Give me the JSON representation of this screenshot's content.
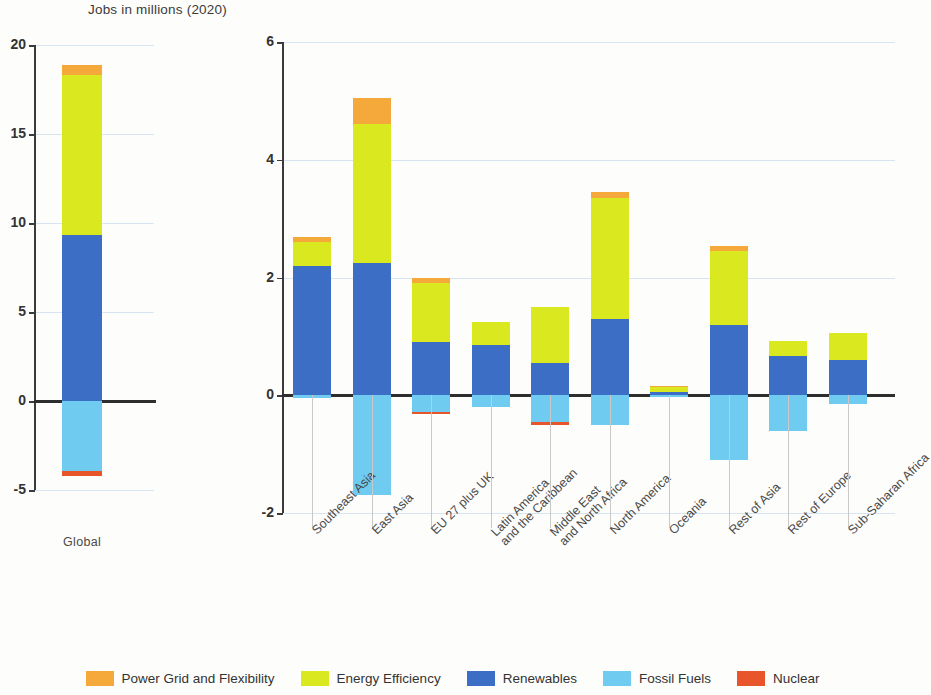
{
  "title": "Jobs in millions (2020)",
  "colors": {
    "power_grid": "#F6A93B",
    "energy_efficiency": "#D9E81F",
    "renewables": "#3B6EC4",
    "fossil_fuels": "#6FCCF0",
    "nuclear": "#E8552B",
    "axis": "#3b3b3b",
    "grid": "#cfe0ef"
  },
  "legend": {
    "position": "bottom",
    "items": [
      {
        "label": "Power Grid and Flexibility",
        "color": "#F6A93B",
        "key": "power_grid"
      },
      {
        "label": "Energy Efficiency",
        "color": "#D9E81F",
        "key": "energy_efficiency"
      },
      {
        "label": "Renewables",
        "color": "#3B6EC4",
        "key": "renewables"
      },
      {
        "label": "Fossil Fuels",
        "color": "#6FCCF0",
        "key": "fossil_fuels"
      },
      {
        "label": "Nuclear",
        "color": "#E8552B",
        "key": "nuclear"
      }
    ]
  },
  "chart_data": [
    {
      "type": "bar",
      "id": "global",
      "stacked": true,
      "title": "Jobs in millions (2020)",
      "xlabel": "",
      "ylabel": "Jobs in millions (2020)",
      "ylim": [
        -5,
        20
      ],
      "yticks": [
        -5,
        0,
        5,
        10,
        15,
        20
      ],
      "ytick_labels": [
        "-5",
        "0",
        "5",
        "10",
        "15",
        "20"
      ],
      "grid": true,
      "categories": [
        "Global"
      ],
      "series": [
        {
          "name": "Renewables",
          "color": "#3B6EC4",
          "values": [
            9.3
          ]
        },
        {
          "name": "Energy Efficiency",
          "color": "#D9E81F",
          "values": [
            9.0
          ]
        },
        {
          "name": "Power Grid and Flexibility",
          "color": "#F6A93B",
          "values": [
            0.6
          ]
        },
        {
          "name": "Fossil Fuels",
          "color": "#6FCCF0",
          "values": [
            -3.95
          ]
        },
        {
          "name": "Nuclear",
          "color": "#E8552B",
          "values": [
            -0.25
          ]
        }
      ],
      "totals_positive": [
        18.9
      ],
      "totals_negative": [
        -4.2
      ]
    },
    {
      "type": "bar",
      "id": "regions",
      "stacked": true,
      "title": "",
      "xlabel": "",
      "ylabel": "Jobs in millions (2020)",
      "ylim": [
        -2,
        6
      ],
      "yticks": [
        -2,
        0,
        2,
        4,
        6
      ],
      "ytick_labels": [
        "-2",
        "0",
        "2",
        "4",
        "6"
      ],
      "grid": true,
      "categories": [
        "Southeast Asia",
        "East Asia",
        "EU 27 plus UK",
        "Latin America\nand the Caribbean",
        "Middle East\nand North Africa",
        "North America",
        "Oceania",
        "Rest of Asia",
        "Rest of Europe",
        "Sub-Saharan Africa"
      ],
      "series": [
        {
          "name": "Renewables",
          "color": "#3B6EC4",
          "values": [
            2.2,
            2.25,
            0.9,
            0.85,
            0.55,
            1.3,
            0.06,
            1.2,
            0.67,
            0.6
          ]
        },
        {
          "name": "Energy Efficiency",
          "color": "#D9E81F",
          "values": [
            0.4,
            2.35,
            1.0,
            0.4,
            0.95,
            2.05,
            0.08,
            1.25,
            0.25,
            0.45
          ]
        },
        {
          "name": "Power Grid and Flexibility",
          "color": "#F6A93B",
          "values": [
            0.08,
            0.45,
            0.1,
            0.0,
            0.0,
            0.1,
            0.02,
            0.08,
            0.0,
            0.0
          ]
        },
        {
          "name": "Fossil Fuels",
          "color": "#6FCCF0",
          "values": [
            -0.05,
            -1.7,
            -0.28,
            -0.2,
            -0.45,
            -0.5,
            -0.02,
            -1.1,
            -0.6,
            -0.15
          ]
        },
        {
          "name": "Nuclear",
          "color": "#E8552B",
          "values": [
            0.0,
            0.0,
            -0.03,
            0.0,
            -0.05,
            0.0,
            0.0,
            0.0,
            0.0,
            0.0
          ]
        }
      ],
      "totals_positive": [
        2.68,
        5.05,
        2.0,
        1.25,
        1.5,
        3.45,
        0.16,
        2.53,
        0.92,
        1.05
      ],
      "totals_negative": [
        -0.05,
        -1.7,
        -0.31,
        -0.2,
        -0.5,
        -0.5,
        -0.02,
        -1.1,
        -0.6,
        -0.15
      ]
    }
  ]
}
